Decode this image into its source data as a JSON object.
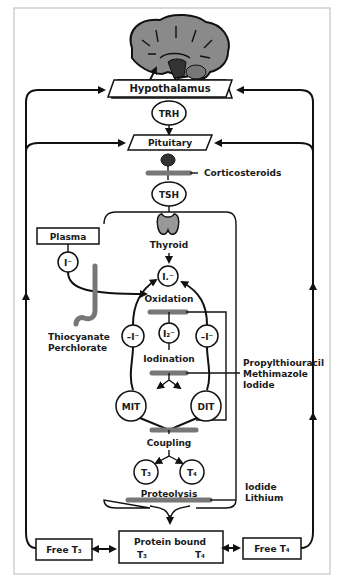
{
  "diagram": {
    "nodes": {
      "hypothalamus": "Hypothalamus",
      "trh": "TRH",
      "pituitary": "Pituitary",
      "tsh": "TSH",
      "thyroid": "Thyroid",
      "plasma": "Plasma",
      "plasma_iodide": "I⁻",
      "iodide_in": "I.⁻",
      "oxidation": "Oxidation",
      "deiodinase_left": "–I⁻",
      "deiodinase_right": "–I⁻",
      "i2": "I₂⁻",
      "iodination": "Iodination",
      "mit": "MIT",
      "dit": "DIT",
      "coupling": "Coupling",
      "t3": "T₃",
      "t4": "T₄",
      "proteolysis": "Proteolysis",
      "protein_bound": "Protein bound",
      "protein_bound_t3": "T₃",
      "protein_bound_t4": "T₄",
      "free_t3": "Free T₃",
      "free_t4": "Free T₄"
    },
    "inhibitors": {
      "corticosteroids": "Corticosteroids",
      "thiocyanate": "Thiocyanate",
      "perchlorate": "Perchlorate",
      "propylthiouracil": "Propylthiouracil",
      "methimazole": "Methimazole",
      "iodide_1": "Iodide",
      "iodide_2": "Iodide",
      "lithium": "Lithium"
    },
    "colors": {
      "line": "#111111",
      "inhibitor_bar": "#777777",
      "brain_fill": "#8a8a8a",
      "thyroid_fill": "#9a9a9a",
      "frame": "#cccccc"
    }
  }
}
